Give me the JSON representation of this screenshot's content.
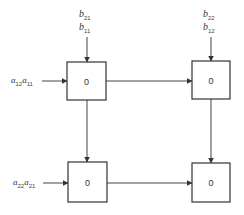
{
  "diagram": {
    "type": "systolic-array",
    "cells": [
      {
        "id": "cell-11",
        "value": "0",
        "x": 67,
        "y": 62,
        "w": 39,
        "h": 38
      },
      {
        "id": "cell-12",
        "value": "0",
        "x": 192,
        "y": 61,
        "w": 38,
        "h": 38
      },
      {
        "id": "cell-21",
        "value": "0",
        "x": 68,
        "y": 162,
        "w": 39,
        "h": 40
      },
      {
        "id": "cell-22",
        "value": "0",
        "x": 192,
        "y": 163,
        "w": 38,
        "h": 39
      }
    ],
    "inputs_top": [
      {
        "col": 1,
        "labels": [
          {
            "base": "b",
            "sub": "21"
          },
          {
            "base": "b",
            "sub": "11"
          }
        ]
      },
      {
        "col": 2,
        "labels": [
          {
            "base": "b",
            "sub": "22"
          },
          {
            "base": "b",
            "sub": "12"
          }
        ]
      }
    ],
    "inputs_left": [
      {
        "row": 1,
        "labels": [
          {
            "base": "a",
            "sub": "12"
          },
          {
            "base": "a",
            "sub": "11"
          }
        ]
      },
      {
        "row": 2,
        "labels": [
          {
            "base": "a",
            "sub": "22"
          },
          {
            "base": "a",
            "sub": "21"
          }
        ]
      }
    ]
  }
}
